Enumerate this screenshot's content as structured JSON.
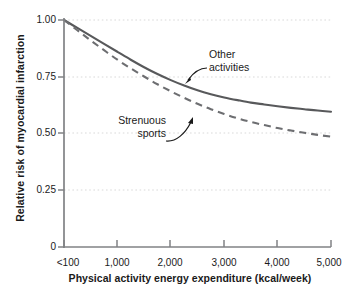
{
  "chart_data": {
    "type": "line",
    "title": "",
    "xlabel": "Physical activity energy expenditure (kcal/week)",
    "ylabel": "Relative risk of myocardial infarction",
    "xlim": [
      0,
      5000
    ],
    "ylim": [
      0,
      1.0
    ],
    "grid": true,
    "grid_axis": "y",
    "legend_position": "inline-annotations",
    "x_tick_labels": [
      "<100",
      "1,000",
      "2,000",
      "3,000",
      "4,000",
      "5,000"
    ],
    "x_tick_values": [
      0,
      1000,
      2000,
      3000,
      4000,
      5000
    ],
    "y_tick_labels": [
      "1.00",
      "0.75",
      "0.50",
      "0.25",
      "0"
    ],
    "y_tick_values": [
      1.0,
      0.75,
      0.5,
      0.25,
      0
    ],
    "x": [
      0,
      250,
      500,
      750,
      1000,
      1250,
      1500,
      1750,
      2000,
      2250,
      2500,
      2750,
      3000,
      3250,
      3500,
      3750,
      4000,
      4250,
      4500,
      4750,
      5000
    ],
    "series": [
      {
        "name": "Other activities",
        "style": "solid",
        "color": "#58595b",
        "values": [
          1.0,
          0.965,
          0.93,
          0.895,
          0.86,
          0.825,
          0.792,
          0.762,
          0.735,
          0.711,
          0.69,
          0.673,
          0.659,
          0.647,
          0.636,
          0.628,
          0.62,
          0.613,
          0.607,
          0.601,
          0.596
        ]
      },
      {
        "name": "Strenuous sports",
        "style": "dashed",
        "color": "#6d6e71",
        "values": [
          1.0,
          0.955,
          0.91,
          0.867,
          0.825,
          0.787,
          0.751,
          0.717,
          0.686,
          0.657,
          0.631,
          0.607,
          0.586,
          0.567,
          0.551,
          0.537,
          0.524,
          0.513,
          0.503,
          0.494,
          0.486
        ]
      }
    ],
    "annotations": [
      {
        "id": "other-activities",
        "lines": [
          "Other",
          "activities"
        ],
        "text": "Other activities",
        "points_to_series": "Other activities",
        "arrow": true
      },
      {
        "id": "strenuous-sports",
        "lines": [
          "Strenuous",
          "sports"
        ],
        "text": "Strenuous sports",
        "points_to_series": "Strenuous sports",
        "arrow": true
      }
    ]
  },
  "axes": {
    "y_title": "Relative risk of myocardial infarction",
    "x_title": "Physical activity energy expenditure (kcal/week)",
    "y_ticks": [
      {
        "label": "1.00"
      },
      {
        "label": "0.75"
      },
      {
        "label": "0.50"
      },
      {
        "label": "0.25"
      },
      {
        "label": "0"
      }
    ],
    "x_ticks": [
      {
        "label": "<100"
      },
      {
        "label": "1,000"
      },
      {
        "label": "2,000"
      },
      {
        "label": "3,000"
      },
      {
        "label": "4,000"
      },
      {
        "label": "5,000"
      }
    ]
  },
  "annotations": {
    "other": {
      "line1": "Other",
      "line2": "activities"
    },
    "strenuous": {
      "line1": "Strenuous",
      "line2": "sports"
    }
  },
  "colors": {
    "axis": "#808285",
    "grid": "#d9d9d9",
    "solid_line": "#58595b",
    "dashed_line": "#6d6e71",
    "text": "#1a1a1a",
    "background": "#ffffff"
  }
}
